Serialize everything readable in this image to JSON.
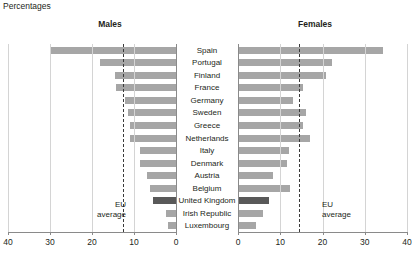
{
  "header": {
    "units_label": "Percentages"
  },
  "panels": {
    "males_title": "Males",
    "females_title": "Females"
  },
  "annotations": {
    "eu_average_line1": "EU",
    "eu_average_line2": "average"
  },
  "axis": {
    "males_ticks": [
      "40",
      "30",
      "20",
      "10",
      "0"
    ],
    "females_ticks": [
      "0",
      "10",
      "20",
      "30",
      "40"
    ],
    "min": 0,
    "max": 40
  },
  "chart_data": {
    "type": "bar",
    "title": "Percentages",
    "subtitle": "",
    "xlabel": "",
    "ylabel": "",
    "orientation": "horizontal",
    "layout": "back-to-back population pyramid, two mirrored panels",
    "grid": true,
    "legend": "none",
    "xlim": [
      0,
      40
    ],
    "xticks": [
      0,
      10,
      20,
      30,
      40
    ],
    "highlight_category": "United Kingdom",
    "colors": {
      "bar": "#a6a6a6",
      "highlight_bar": "#595959",
      "gridline": "#d4d4d4",
      "axis": "#8a8a8a",
      "eu_average_line": "#3a3a3a",
      "text": "#231f20",
      "background": "#ffffff"
    },
    "reference_lines": [
      {
        "panel": "Males",
        "label": "EU average",
        "value": 12.6,
        "style": "dashed"
      },
      {
        "panel": "Females",
        "label": "EU average",
        "value": 14.4,
        "style": "dashed"
      }
    ],
    "categories": [
      "Spain",
      "Portugal",
      "Finland",
      "France",
      "Germany",
      "Sweden",
      "Greece",
      "Netherlands",
      "Italy",
      "Denmark",
      "Austria",
      "Belgium",
      "United Kingdom",
      "Irish Republic",
      "Luxembourg"
    ],
    "series": [
      {
        "name": "Males",
        "panel": "left",
        "values": [
          30.0,
          18.2,
          14.5,
          14.3,
          12.2,
          11.5,
          11.0,
          11.0,
          8.5,
          8.6,
          7.0,
          6.2,
          5.4,
          2.3,
          1.8
        ]
      },
      {
        "name": "Females",
        "panel": "right",
        "values": [
          34.3,
          22.2,
          20.8,
          15.5,
          13.0,
          16.0,
          15.3,
          17.0,
          12.0,
          11.5,
          8.3,
          12.2,
          7.4,
          5.8,
          4.2
        ]
      }
    ]
  }
}
